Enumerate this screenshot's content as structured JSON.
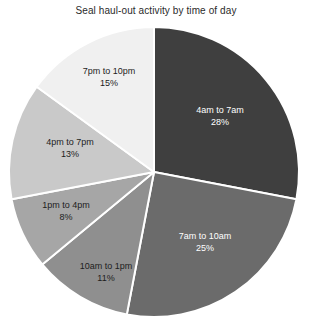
{
  "chart_data": {
    "type": "pie",
    "title": "Seal haul-out activity by time of day",
    "xlabel": "",
    "ylabel": "",
    "legend_position": "none",
    "grid": false,
    "labels_inside": true,
    "start_angle_deg": 0,
    "direction": "clockwise",
    "categories": [
      "4am to 7am",
      "7am to 10am",
      "10am to 1pm",
      "1pm to 4pm",
      "4pm to 7pm",
      "7pm to 10pm"
    ],
    "values": [
      28,
      25,
      11,
      8,
      13,
      15
    ],
    "value_suffix": "%",
    "colors": [
      "#3f3f3f",
      "#6b6b6b",
      "#8f8f8f",
      "#a6a6a6",
      "#c9c9c9",
      "#f0f0f0"
    ],
    "slice_border_color": "#ffffff",
    "slices": [
      {
        "label": "4am to 7am",
        "value": 28,
        "display": "28%",
        "color": "#3f3f3f",
        "text_color": "#ffffff"
      },
      {
        "label": "7am to 10am",
        "value": 25,
        "display": "25%",
        "color": "#6b6b6b",
        "text_color": "#ffffff"
      },
      {
        "label": "10am to 1pm",
        "value": 11,
        "display": "11%",
        "color": "#8f8f8f",
        "text_color": "#1d1d1d"
      },
      {
        "label": "1pm to 4pm",
        "value": 8,
        "display": "8%",
        "color": "#a6a6a6",
        "text_color": "#1d1d1d"
      },
      {
        "label": "4pm to 7pm",
        "value": 13,
        "display": "13%",
        "color": "#c9c9c9",
        "text_color": "#1d1d1d"
      },
      {
        "label": "7pm to 10pm",
        "value": 15,
        "display": "15%",
        "color": "#f0f0f0",
        "text_color": "#1d1d1d"
      }
    ],
    "total": 100
  }
}
